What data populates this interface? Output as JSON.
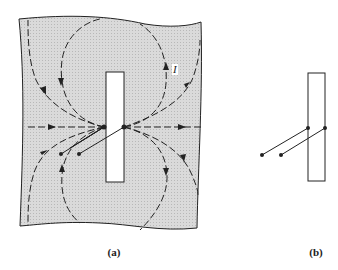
{
  "figure": {
    "panels": [
      {
        "id": "a",
        "label": "(a)",
        "description": "Conducting sheet with rectangular slot and current flow lines"
      },
      {
        "id": "b",
        "label": "(b)",
        "description": "Slot with two leads attached at its edges"
      }
    ],
    "current_label": "I",
    "colors": {
      "sheet_fill": "#d4d4d4",
      "line": "#222222",
      "background": "#ffffff"
    }
  }
}
